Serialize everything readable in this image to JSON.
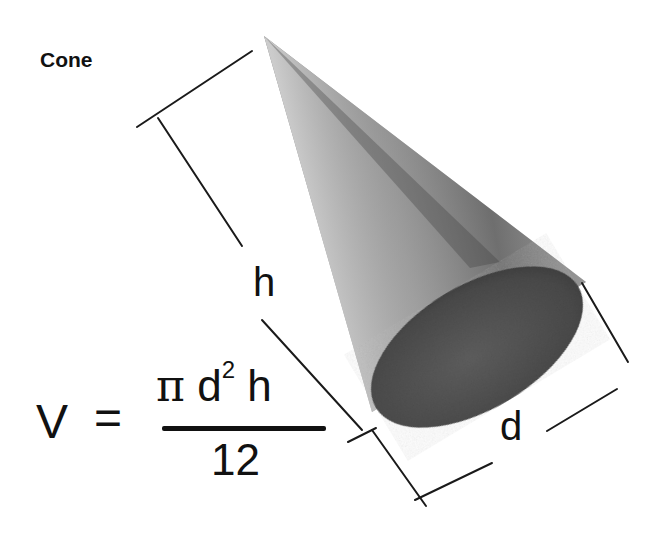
{
  "diagram": {
    "title": "Cone",
    "labels": {
      "height": "h",
      "diameter": "d"
    },
    "formula": {
      "lhs": "V",
      "equals": "=",
      "numerator_pi": "π",
      "numerator_d": "d",
      "numerator_exp": "2",
      "numerator_h": "h",
      "denominator": "12"
    },
    "colors": {
      "background": "#ffffff",
      "cone_light": "#c8c8c8",
      "cone_dark": "#5a5a5a",
      "base_fill": "#4a4a4a",
      "line": "#1a1a1a",
      "text": "#111111"
    }
  }
}
